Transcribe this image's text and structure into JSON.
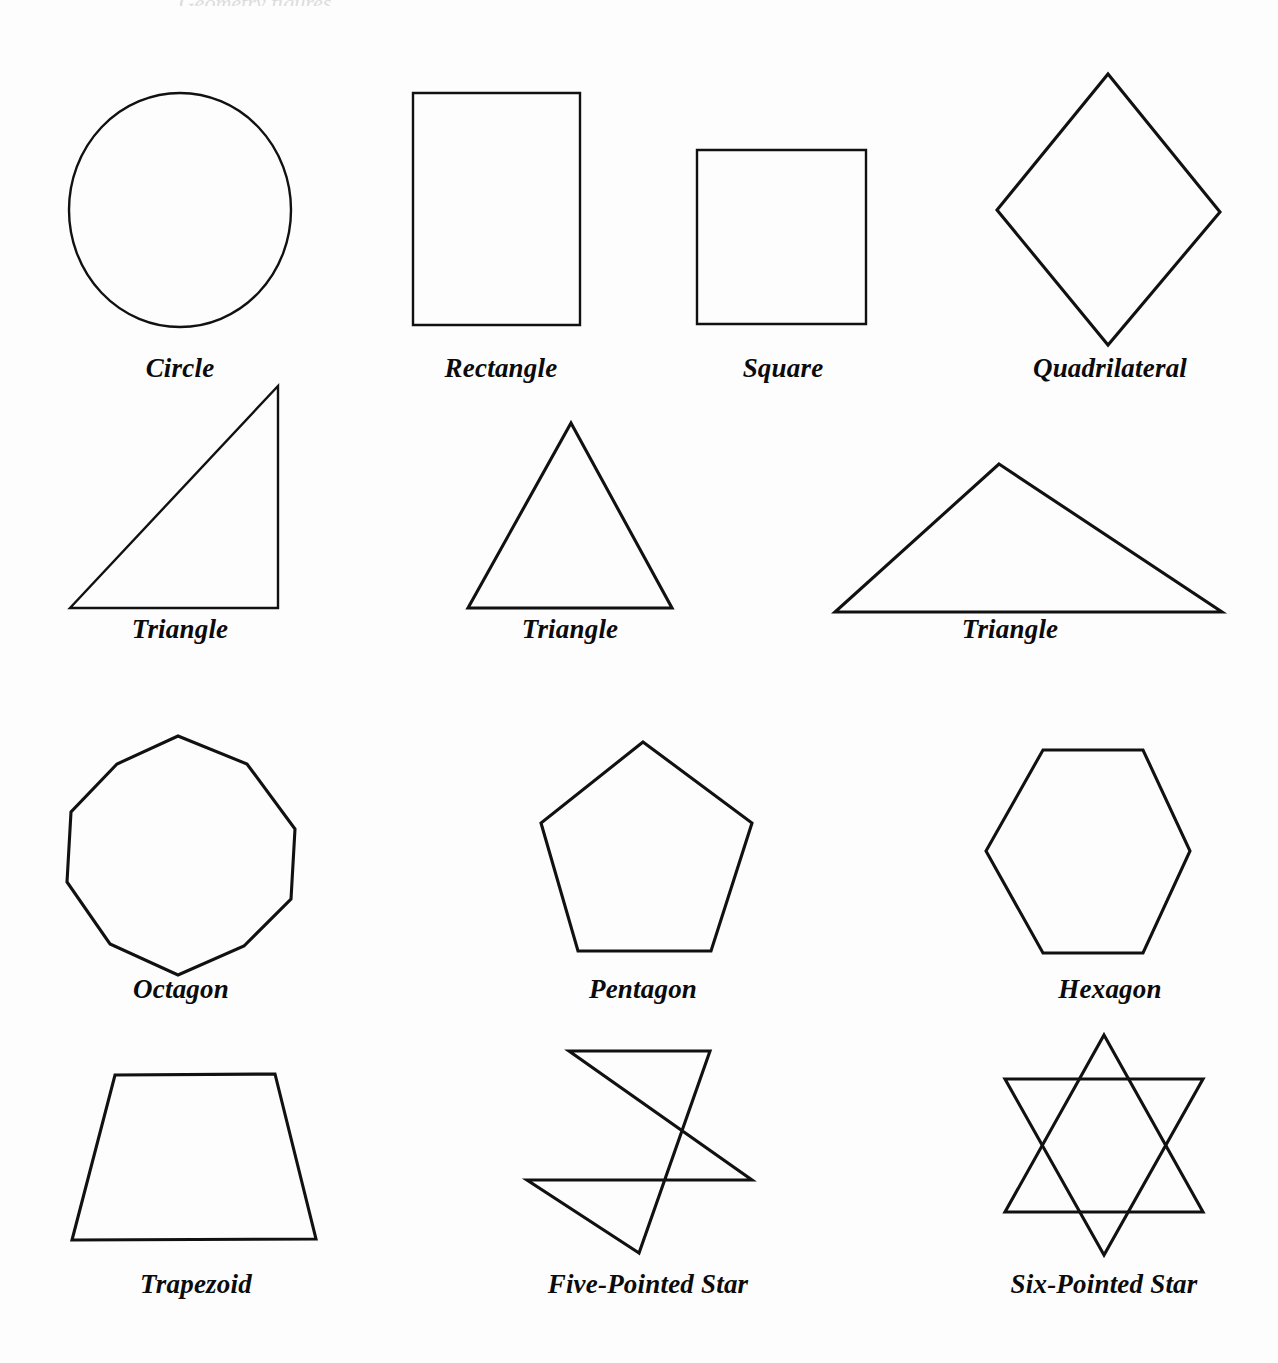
{
  "page": {
    "background_color": "#fdfdfd",
    "stroke_color": "#111111",
    "width": 1278,
    "height": 1363,
    "cropped_header_text": "Geometry figures"
  },
  "figure": {
    "caption_style": "bold-italic-serif",
    "rows": 4,
    "shape_count": 14
  },
  "shapes": [
    {
      "id": "circle",
      "label": "Circle",
      "kind": "circle",
      "row": 1,
      "label_x": 180,
      "label_y": 355,
      "geometry": {
        "cx": 180,
        "cy": 210,
        "rx": 111,
        "ry": 117
      }
    },
    {
      "id": "rectangle",
      "label": "Rectangle",
      "kind": "polygon",
      "row": 1,
      "label_x": 501,
      "label_y": 355,
      "points": "413,93 580,93 580,325 413,325"
    },
    {
      "id": "square",
      "label": "Square",
      "kind": "polygon",
      "row": 1,
      "label_x": 783,
      "label_y": 355,
      "points": "697,150 866,150 866,324 697,324"
    },
    {
      "id": "quadrilateral",
      "label": "Quadrilateral",
      "kind": "polygon",
      "row": 1,
      "label_x": 1110,
      "label_y": 355,
      "points": "1108,74 1220,212 1108,345 997,210"
    },
    {
      "id": "triangle-right",
      "label": "Triangle",
      "kind": "polygon",
      "row": 2,
      "label_x": 180,
      "label_y": 616,
      "points": "278,386 278,608 70,608"
    },
    {
      "id": "triangle-equilateral",
      "label": "Triangle",
      "kind": "polygon",
      "row": 2,
      "label_x": 570,
      "label_y": 616,
      "points": "571,423 672,608 468,608"
    },
    {
      "id": "triangle-obtuse",
      "label": "Triangle",
      "kind": "polygon",
      "row": 2,
      "label_x": 1010,
      "label_y": 616,
      "points": "999,464 1222,612 835,612"
    },
    {
      "id": "octagon",
      "label": "Octagon",
      "kind": "polygon",
      "row": 3,
      "label_x": 181,
      "label_y": 976,
      "points": "178,736 247,764 295,829 291,899 244,946 178,975 110,944 67,882 71,812 117,764"
    },
    {
      "id": "pentagon",
      "label": "Pentagon",
      "kind": "polygon",
      "row": 3,
      "label_x": 643,
      "label_y": 976,
      "points": "643,742 752,823 711,951 578,951 541,823"
    },
    {
      "id": "hexagon",
      "label": "Hexagon",
      "kind": "polygon",
      "row": 3,
      "label_x": 1110,
      "label_y": 976,
      "points": "1043,750 1143,750 1190,851 1143,953 1043,953 986,851"
    },
    {
      "id": "trapezoid",
      "label": "Trapezoid",
      "kind": "polygon",
      "row": 4,
      "label_x": 196,
      "label_y": 1271,
      "points": "115,1075 275,1074 316,1239 72,1240"
    },
    {
      "id": "five-pointed-star",
      "label": "Five-Pointed Star",
      "kind": "star5",
      "row": 4,
      "label_x": 648,
      "label_y": 1271,
      "points": "639,1253 527,1180 752,1180 569,1051 710,1051"
    },
    {
      "id": "six-pointed-star",
      "label": "Six-Pointed Star",
      "kind": "star6",
      "row": 4,
      "label_x": 1104,
      "label_y": 1271,
      "triangle_up": "1104,1035 1203,1212 1005,1212",
      "triangle_down": "1104,1255 1005,1079 1203,1079"
    }
  ]
}
